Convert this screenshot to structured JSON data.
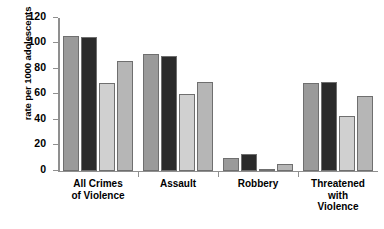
{
  "chart_data": {
    "type": "bar",
    "title": "",
    "xlabel": "",
    "ylabel": "rate per 1000 adolescents",
    "ylim": [
      0,
      120
    ],
    "ytick_step": 20,
    "yticks": [
      0,
      20,
      40,
      60,
      80,
      100,
      120
    ],
    "ytick_labels": [
      "0",
      "20",
      "40",
      "60",
      "80",
      "100",
      "120"
    ],
    "grid": false,
    "legend": "none",
    "categories": [
      "All Crimes of Violence",
      "Assault",
      "Robbery",
      "Threatened with Violence"
    ],
    "category_lines": [
      [
        "All Crimes",
        "of Violence"
      ],
      [
        "Assault"
      ],
      [
        "Robbery"
      ],
      [
        "Threatened",
        "with",
        "Violence"
      ]
    ],
    "series": [
      {
        "name": "series-1",
        "color": "#9a9a9a",
        "values": [
          106,
          92,
          10,
          69
        ]
      },
      {
        "name": "series-2",
        "color": "#2b2b2b",
        "values": [
          105,
          90,
          13,
          70
        ]
      },
      {
        "name": "series-3",
        "color": "#d0d0d0",
        "values": [
          69,
          60,
          1,
          43
        ]
      },
      {
        "name": "series-4",
        "color": "#b6b6b6",
        "values": [
          86,
          70,
          5,
          59
        ]
      }
    ]
  },
  "axis": {
    "axis_color": "#8f8f8f"
  }
}
